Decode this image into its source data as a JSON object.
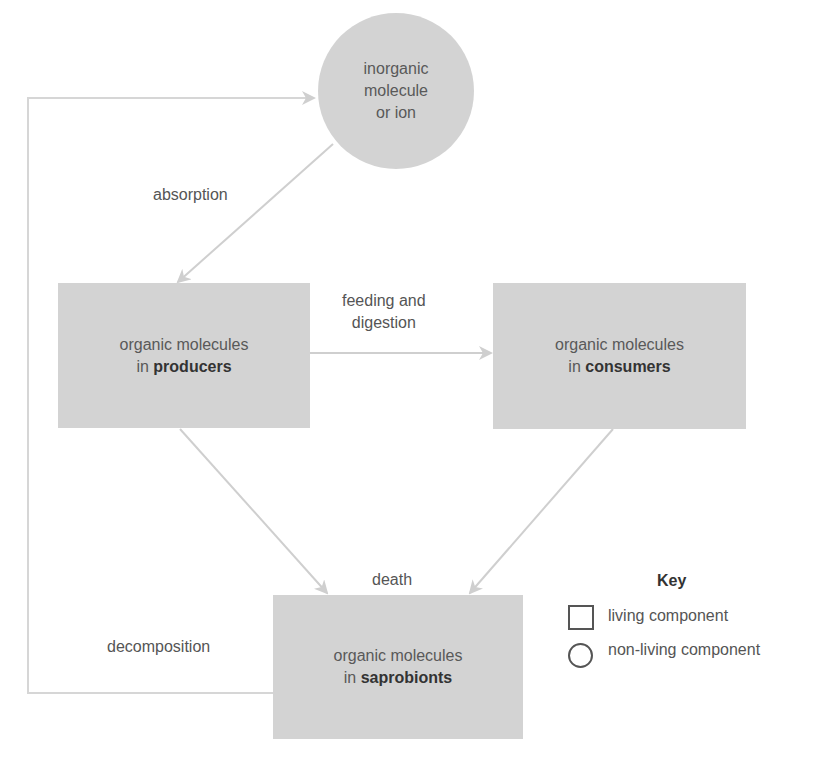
{
  "diagram": {
    "nodes": {
      "inorganic": {
        "line1": "inorganic",
        "line2": "molecule",
        "line3": "or ion",
        "shape": "circle"
      },
      "producers": {
        "line1": "organic molecules",
        "prefix": "in",
        "bold": "producers",
        "shape": "rectangle"
      },
      "consumers": {
        "line1": "organic molecules",
        "prefix": "in",
        "bold": "consumers",
        "shape": "rectangle"
      },
      "saprobionts": {
        "line1": "organic molecules",
        "prefix": "in",
        "bold": "saprobionts",
        "shape": "rectangle"
      }
    },
    "edges": {
      "absorption": {
        "label": "absorption",
        "from": "inorganic",
        "to": "producers"
      },
      "feeding": {
        "label_line1": "feeding and",
        "label_line2": "digestion",
        "from": "producers",
        "to": "consumers"
      },
      "death": {
        "label": "death",
        "from": [
          "producers",
          "consumers"
        ],
        "to": "saprobionts"
      },
      "decomposition": {
        "label": "decomposition",
        "from": "saprobionts",
        "to": "inorganic"
      }
    },
    "key": {
      "title": "Key",
      "items": [
        {
          "shape": "square",
          "label": "living component"
        },
        {
          "shape": "circle",
          "label": "non-living component"
        }
      ]
    },
    "colors": {
      "node_fill": "#d3d3d3",
      "arrow": "#cfcfcf",
      "text": "#555555"
    }
  }
}
